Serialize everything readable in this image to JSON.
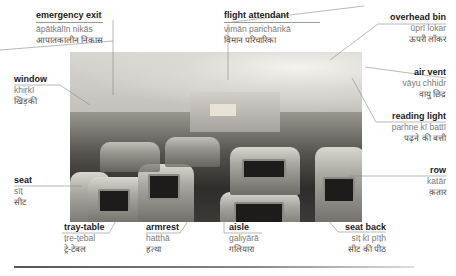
{
  "labels": {
    "emergency_exit": {
      "en": "emergency exit",
      "translit": "āpātkālīn nikās",
      "hi": "आपातकालीन निकास"
    },
    "flight_attendant": {
      "en": "flight attendant",
      "translit": "vimān parichārikā",
      "hi": "विमान परिचारिका"
    },
    "overhead_bin": {
      "en": "overhead bin",
      "translit": "ūprī lokar",
      "hi": "ऊपरी लॉकर"
    },
    "window": {
      "en": "window",
      "translit": "khiṛkī",
      "hi": "खिड़की"
    },
    "air_vent": {
      "en": "air vent",
      "translit": "vāyu chhidr",
      "hi": "वायु छिद्र"
    },
    "reading_light": {
      "en": "reading light",
      "translit": "parhne kī battī",
      "hi": "पढ़ने की बत्ती"
    },
    "seat": {
      "en": "seat",
      "translit": "sīṭ",
      "hi": "सीट"
    },
    "row": {
      "en": "row",
      "translit": "katār",
      "hi": "क़तार"
    },
    "tray_table": {
      "en": "tray-table",
      "translit": "ṭre-ṭebal",
      "hi": "ट्रे-टेबल"
    },
    "armrest": {
      "en": "armrest",
      "translit": "hatthā",
      "hi": "हत्था"
    },
    "aisle": {
      "en": "aisle",
      "translit": "galiyārā",
      "hi": "गलियारा"
    },
    "seat_back": {
      "en": "seat back",
      "translit": "sīṭ kī pīṭh",
      "hi": "सीट की पीठ"
    }
  },
  "photo": {
    "subject": "aircraft cabin interior"
  }
}
